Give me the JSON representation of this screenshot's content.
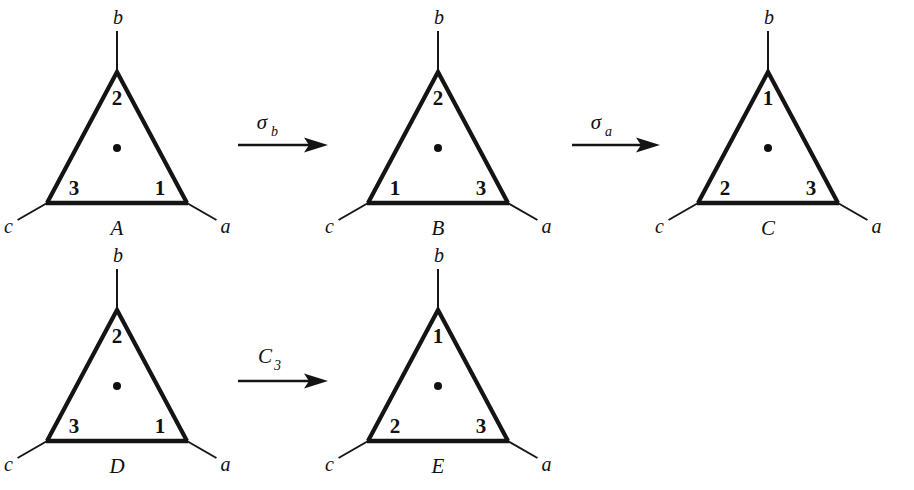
{
  "figure": {
    "background_color": "#ffffff",
    "ink_color": "#141414",
    "rows": 2
  },
  "triangles": [
    {
      "name": "A",
      "row": 1,
      "apex_x": 117,
      "apex_y": 72,
      "half_width": 70,
      "height": 131,
      "corners": {
        "top": "2",
        "bottom_left": "3",
        "bottom_right": "1"
      },
      "axes": {
        "top": "b",
        "bottom_left": "c",
        "bottom_right": "a"
      },
      "has_center_dot": true
    },
    {
      "name": "B",
      "row": 1,
      "apex_x": 438,
      "apex_y": 72,
      "half_width": 70,
      "height": 131,
      "corners": {
        "top": "2",
        "bottom_left": "1",
        "bottom_right": "3"
      },
      "axes": {
        "top": "b",
        "bottom_left": "c",
        "bottom_right": "a"
      },
      "has_center_dot": true
    },
    {
      "name": "C",
      "row": 1,
      "apex_x": 768,
      "apex_y": 72,
      "half_width": 70,
      "height": 131,
      "corners": {
        "top": "1",
        "bottom_left": "2",
        "bottom_right": "3"
      },
      "axes": {
        "top": "b",
        "bottom_left": "c",
        "bottom_right": "a"
      },
      "has_center_dot": true
    },
    {
      "name": "D",
      "row": 2,
      "apex_x": 117,
      "apex_y": 310,
      "half_width": 70,
      "height": 131,
      "corners": {
        "top": "2",
        "bottom_left": "3",
        "bottom_right": "1"
      },
      "axes": {
        "top": "b",
        "bottom_left": "c",
        "bottom_right": "a"
      },
      "has_center_dot": true
    },
    {
      "name": "E",
      "row": 2,
      "apex_x": 438,
      "apex_y": 310,
      "half_width": 70,
      "height": 131,
      "corners": {
        "top": "1",
        "bottom_left": "2",
        "bottom_right": "3"
      },
      "axes": {
        "top": "b",
        "bottom_left": "c",
        "bottom_right": "a"
      },
      "has_center_dot": true
    }
  ],
  "operations": [
    {
      "id": "sigma-b",
      "symbol": "σ",
      "subscript": "b",
      "from": "A",
      "to": "B",
      "shaft_x1": 238,
      "shaft_x2": 328,
      "shaft_y": 145,
      "label_x": 262,
      "label_y": 129
    },
    {
      "id": "sigma-a",
      "symbol": "σ",
      "subscript": "a",
      "from": "B",
      "to": "C",
      "shaft_x1": 572,
      "shaft_x2": 660,
      "shaft_y": 145,
      "label_x": 596,
      "label_y": 129
    },
    {
      "id": "c3",
      "symbol": "C",
      "subscript": "3",
      "from": "D",
      "to": "E",
      "shaft_x1": 238,
      "shaft_x2": 328,
      "shaft_y": 381,
      "label_x": 265,
      "label_y": 363
    }
  ],
  "legend": {
    "vertex_axis_top": "b",
    "vertex_axis_left": "c",
    "vertex_axis_right": "a",
    "numbers": [
      "1",
      "2",
      "3"
    ],
    "triangle_names": [
      "A",
      "B",
      "C",
      "D",
      "E"
    ],
    "operation_labels": [
      "σb",
      "σa",
      "C3"
    ]
  }
}
